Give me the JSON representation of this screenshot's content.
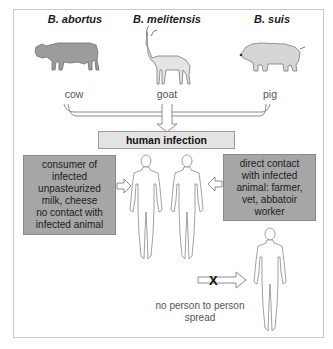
{
  "diagram": {
    "species": [
      {
        "name": "B. abortus",
        "animal": "cow",
        "icon": "cow-icon",
        "fill": "#9c9c9c"
      },
      {
        "name": "B. melitensis",
        "animal": "goat",
        "icon": "goat-icon",
        "fill": "#e4e4e4"
      },
      {
        "name": "B. suis",
        "animal": "pig",
        "icon": "pig-icon",
        "fill": "#d6d6d6"
      }
    ],
    "center_box": {
      "label": "human infection",
      "fill": "#e3e3e3"
    },
    "left_box": {
      "lines": [
        "consumer of",
        "infected",
        "unpasteurized",
        "milk, cheese",
        "no contact with",
        "infected animal"
      ],
      "fill": "#a6a6a6"
    },
    "right_box": {
      "lines": [
        "direct contact",
        "with infected",
        "animal: farmer,",
        "vet, abbatoir",
        "worker"
      ],
      "fill": "#a6a6a6"
    },
    "blocked_arrow": {
      "mark": "X"
    },
    "caption": {
      "lines": [
        "no person to person",
        "spread"
      ]
    }
  }
}
